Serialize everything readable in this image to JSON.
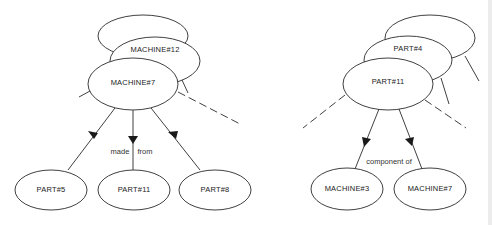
{
  "diagram": {
    "left": {
      "stack": {
        "back_label": "",
        "middle_label": "MACHINE#12",
        "front_label": "MACHINE#7"
      },
      "relation_label_left": "made",
      "relation_label_right": "from",
      "children": [
        {
          "label": "PART#5"
        },
        {
          "label": "PART#11"
        },
        {
          "label": "PART#8"
        }
      ]
    },
    "right": {
      "stack": {
        "back_label": "",
        "middle_label": "PART#4",
        "front_label": "PART#11"
      },
      "relation_label": "component of",
      "children": [
        {
          "label": "MACHINE#3"
        },
        {
          "label": "MACHINE#7"
        }
      ]
    },
    "colors": {
      "stroke": "#2a2a2a",
      "background": "#ffffff",
      "text": "#222222"
    }
  }
}
